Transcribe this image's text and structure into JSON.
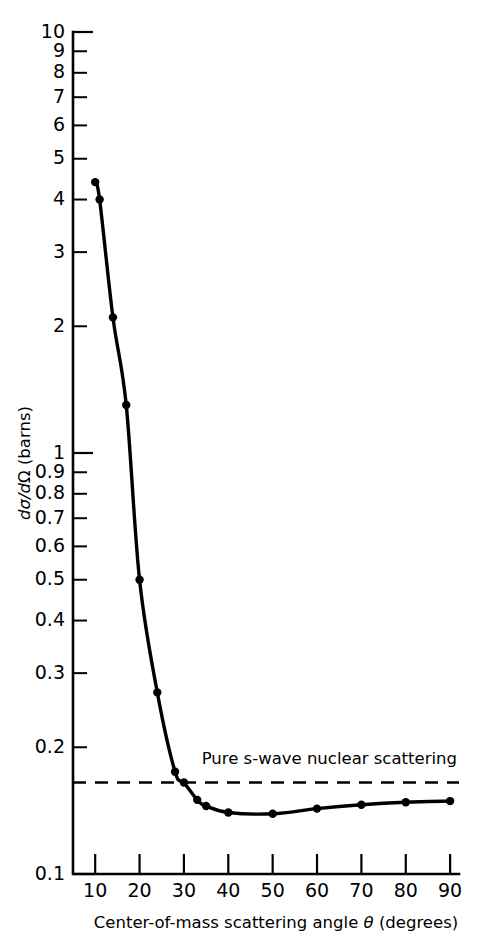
{
  "chart_data": {
    "type": "line",
    "title": "",
    "xlabel": "Center-of-mass scattering angle θ (degrees)",
    "ylabel": "dσ/dΩ (barns)",
    "yscale": "log",
    "xscale": "linear",
    "xlim": [
      5,
      92
    ],
    "ylim": [
      0.1,
      10
    ],
    "grid": false,
    "legend": null,
    "x": [
      10,
      11,
      14,
      17,
      20,
      24,
      28,
      30,
      33,
      35,
      40,
      50,
      60,
      70,
      80,
      90
    ],
    "values": [
      4.4,
      4.0,
      2.1,
      1.3,
      0.5,
      0.27,
      0.175,
      0.165,
      0.15,
      0.145,
      0.14,
      0.139,
      0.143,
      0.146,
      0.148,
      0.149
    ],
    "series": [
      {
        "name": "measured differential cross section",
        "x": [
          10,
          11,
          14,
          17,
          20,
          24,
          28,
          30,
          33,
          35,
          40,
          50,
          60,
          70,
          80,
          90
        ],
        "values": [
          4.4,
          4.0,
          2.1,
          1.3,
          0.5,
          0.27,
          0.175,
          0.165,
          0.15,
          0.145,
          0.14,
          0.139,
          0.143,
          0.146,
          0.148,
          0.149
        ],
        "marker": "filled-circle",
        "linestyle": "solid"
      }
    ],
    "reference_lines": [
      {
        "name": "pure-s-wave-nuclear-scattering",
        "orientation": "horizontal",
        "value": 0.165,
        "linestyle": "dashed",
        "label": "Pure s-wave nuclear scattering",
        "x_start": 5,
        "x_end": 92
      }
    ],
    "annotations": [
      {
        "text": "Pure s-wave nuclear scattering",
        "x": 34,
        "y": 0.183
      }
    ],
    "y_ticks_major": [
      {
        "value": 10,
        "label": "10"
      },
      {
        "value": 9,
        "label": "9"
      },
      {
        "value": 8,
        "label": "8"
      },
      {
        "value": 7,
        "label": "7"
      },
      {
        "value": 6,
        "label": "6"
      },
      {
        "value": 5,
        "label": "5"
      },
      {
        "value": 4,
        "label": "4"
      },
      {
        "value": 3,
        "label": "3"
      },
      {
        "value": 2,
        "label": "2"
      },
      {
        "value": 1,
        "label": "1"
      },
      {
        "value": 0.9,
        "label": "0.9"
      },
      {
        "value": 0.8,
        "label": "0.8"
      },
      {
        "value": 0.7,
        "label": "0.7"
      },
      {
        "value": 0.6,
        "label": "0.6"
      },
      {
        "value": 0.5,
        "label": "0.5"
      },
      {
        "value": 0.4,
        "label": "0.4"
      },
      {
        "value": 0.3,
        "label": "0.3"
      },
      {
        "value": 0.2,
        "label": "0.2"
      },
      {
        "value": 0.1,
        "label": "0.1"
      }
    ],
    "x_ticks_major": [
      {
        "value": 10,
        "label": "10"
      },
      {
        "value": 20,
        "label": "20"
      },
      {
        "value": 30,
        "label": "30"
      },
      {
        "value": 40,
        "label": "40"
      },
      {
        "value": 50,
        "label": "50"
      },
      {
        "value": 60,
        "label": "60"
      },
      {
        "value": 70,
        "label": "70"
      },
      {
        "value": 80,
        "label": "80"
      },
      {
        "value": 90,
        "label": "90"
      }
    ],
    "colors": {
      "curve": "#000000",
      "marker": "#000000",
      "axis": "#000000",
      "reference_line": "#000000",
      "background": "#ffffff"
    }
  },
  "ylabel_parts": {
    "d1": "d",
    "sigma": "σ",
    "slash": "/",
    "d2": "d",
    "omega": "Ω",
    "units": " (barns)"
  },
  "xlabel_parts": {
    "prefix": "Center-of-mass scattering angle ",
    "theta": "θ",
    "suffix": " (degrees)"
  }
}
